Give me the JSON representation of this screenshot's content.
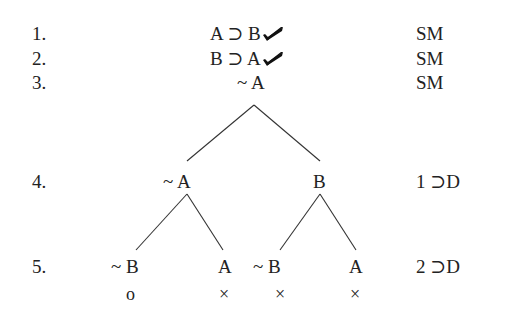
{
  "tree": {
    "rows": [
      {
        "number": "1.",
        "formula": "A ⊃ B",
        "checked": true,
        "justification": "SM"
      },
      {
        "number": "2.",
        "formula": "B ⊃ A",
        "checked": true,
        "justification": "SM"
      },
      {
        "number": "3.",
        "formula": "~ A",
        "checked": false,
        "justification": "SM"
      },
      {
        "number": "4.",
        "branches": [
          "~ A",
          "B"
        ],
        "justification": "1 ⊃D"
      },
      {
        "number": "5.",
        "branches": [
          "~ B",
          "A",
          "~ B",
          "A"
        ],
        "justification": "2 ⊃D"
      }
    ],
    "branch_marks": [
      "o",
      "×",
      "×",
      "×"
    ],
    "check_icon": "check-mark-icon",
    "line_color": "#333333"
  }
}
